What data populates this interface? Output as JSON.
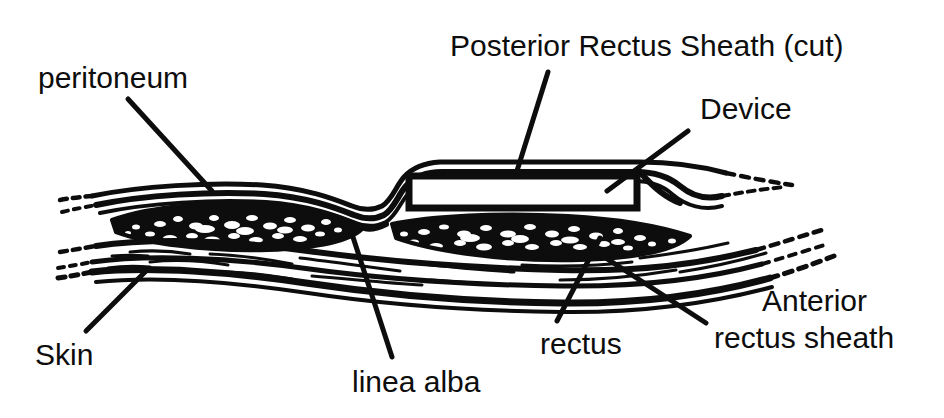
{
  "figure": {
    "type": "anatomical-line-drawing",
    "width": 944,
    "height": 418,
    "background_color": "#ffffff",
    "ink_color": "#0d0d0d"
  },
  "labels": [
    {
      "id": "peritoneum",
      "text": "peritoneum",
      "x": 38,
      "y": 88,
      "anchor": "start",
      "font_size": 30,
      "leader": {
        "x1": 128,
        "y1": 99,
        "x2": 212,
        "y2": 191
      }
    },
    {
      "id": "posterior-rectus-sheath",
      "text": "Posterior Rectus Sheath (cut)",
      "x": 450,
      "y": 56,
      "anchor": "start",
      "font_size": 30,
      "leader": {
        "x1": 548,
        "y1": 72,
        "x2": 516,
        "y2": 174
      }
    },
    {
      "id": "device",
      "text": "Device",
      "x": 700,
      "y": 119,
      "anchor": "start",
      "font_size": 30,
      "leader": {
        "x1": 688,
        "y1": 131,
        "x2": 607,
        "y2": 191
      }
    },
    {
      "id": "skin",
      "text": "Skin",
      "x": 35,
      "y": 365,
      "anchor": "start",
      "font_size": 30,
      "leader": {
        "x1": 86,
        "y1": 331,
        "x2": 146,
        "y2": 271
      }
    },
    {
      "id": "linea-alba",
      "text": "linea alba",
      "x": 352,
      "y": 392,
      "anchor": "start",
      "font_size": 30,
      "leader": {
        "x1": 392,
        "y1": 357,
        "x2": 351,
        "y2": 231
      }
    },
    {
      "id": "rectus",
      "text": "rectus",
      "x": 540,
      "y": 354,
      "anchor": "start",
      "font_size": 30,
      "leader": {
        "x1": 557,
        "y1": 321,
        "x2": 600,
        "y2": 238
      }
    },
    {
      "id": "anterior-rectus-sheath",
      "text": "Anterior",
      "text_line2": "rectus sheath",
      "x": 762,
      "y": 311,
      "x2": 714,
      "y2": 348,
      "anchor": "start",
      "font_size": 30,
      "leader": {
        "x1": 706,
        "y1": 323,
        "x2": 592,
        "y2": 249
      }
    }
  ],
  "structures": [
    {
      "id": "peritoneum-layer",
      "label": "peritoneum",
      "description": "thin innermost membrane running along the top of the section"
    },
    {
      "id": "posterior-rectus-sheath-layer",
      "label": "Posterior Rectus Sheath (cut)",
      "description": "cut sheath layer elevated over the device on the right half"
    },
    {
      "id": "rectus-muscle-left",
      "label": "rectus",
      "description": "stippled muscle belly on the left of the linea alba"
    },
    {
      "id": "rectus-muscle-right",
      "label": "rectus",
      "description": "stippled muscle belly beneath the device on the right"
    },
    {
      "id": "linea-alba-structure",
      "label": "linea alba",
      "description": "midline fibrous raphe where the two rectus bellies meet"
    },
    {
      "id": "anterior-rectus-sheath-layer",
      "label": "Anterior rectus sheath",
      "description": "fascial layer beneath the muscle"
    },
    {
      "id": "skin-layer",
      "label": "Skin",
      "description": "outermost layer along the bottom of the section"
    },
    {
      "id": "device-implant",
      "label": "Device",
      "description": "white rectangular implant seated on the rectus muscle under the cut posterior sheath"
    }
  ],
  "device_geometry": {
    "left": 408,
    "top": 174,
    "right": 638,
    "bottom": 209
  }
}
